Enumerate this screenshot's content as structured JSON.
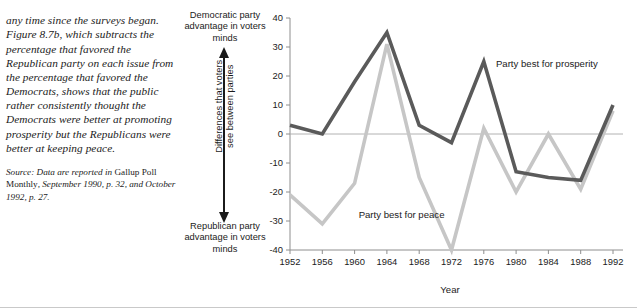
{
  "narrative": {
    "body": "any time since the surveys began. Figure 8.7b, which subtracts the percentage that favored the Republican party on each issue from the percentage that favored the Democrats, shows that the public rather consistently thought the Democrats were better at promoting prosperity but the Republicans were better at keeping peace.",
    "source_prefix": "Source: Data are reported in ",
    "source_pub": "Gallup Poll Monthly",
    "source_rest": ", September 1990, p. 32, and October 1992, p. 27."
  },
  "vertical_axis": {
    "top_caption": "Democratic party advantage in voters minds",
    "bottom_caption": "Republican party advantage in voters minds",
    "label_line1": "Differences that voters",
    "label_line2": "see between parties",
    "arrow_icon": "double-headed-vertical-arrow-icon"
  },
  "chart_data": {
    "type": "line",
    "title": "",
    "xlabel": "Year",
    "ylabel": "",
    "x": [
      1952,
      1956,
      1960,
      1964,
      1968,
      1972,
      1976,
      1980,
      1984,
      1988,
      1992
    ],
    "categories": [
      "1952",
      "1956",
      "1960",
      "1964",
      "1968",
      "1972",
      "1976",
      "1980",
      "1984",
      "1988",
      "1992"
    ],
    "yticks": [
      40,
      30,
      20,
      10,
      0,
      -10,
      -20,
      -30,
      -40
    ],
    "yticklabels": [
      "40",
      "30",
      "20",
      "10",
      "0",
      "-10",
      "-20",
      "-30",
      "-40"
    ],
    "ylim": [
      -40,
      40
    ],
    "xlim": [
      1952,
      1992
    ],
    "grid": false,
    "zero_line": true,
    "legend_position": "inline-annotations",
    "series": [
      {
        "name": "Party best for prosperity",
        "color": "#5a5a5a",
        "values": [
          3,
          0,
          18,
          35,
          3,
          -3,
          25,
          -13,
          -15,
          -16,
          10
        ],
        "label_x": 1977.5,
        "label_y": 24
      },
      {
        "name": "Party best for peace",
        "color": "#c6c6c6",
        "values": [
          -21,
          -31,
          -17,
          31,
          -15,
          -40,
          2,
          -20,
          0,
          -19,
          8
        ],
        "label_x": 1960.5,
        "label_y": -28
      }
    ]
  }
}
